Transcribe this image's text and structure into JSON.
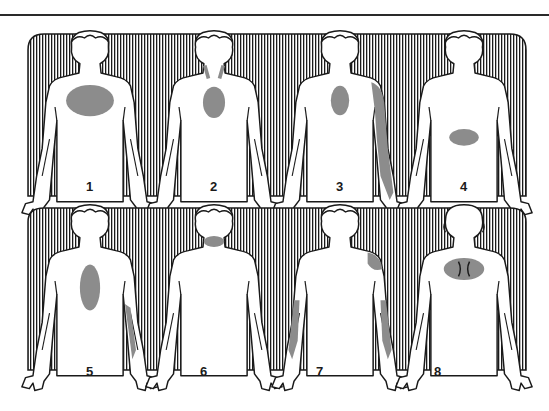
{
  "colors": {
    "line": "#1a1a1a",
    "hatch": "#1a1a1a",
    "figure_fill": "#ffffff",
    "pain_area": "#8c8c8c",
    "background": "#ffffff"
  },
  "rows": [
    {
      "name": "top-row",
      "figures": [
        {
          "label": "1",
          "view": "front",
          "pain_areas": [
            "central chest (wide)"
          ]
        },
        {
          "label": "2",
          "view": "front",
          "pain_areas": [
            "central chest (small)",
            "neck sides"
          ]
        },
        {
          "label": "3",
          "view": "front",
          "pain_areas": [
            "central chest",
            "left shoulder",
            "left arm"
          ]
        },
        {
          "label": "4",
          "view": "front",
          "pain_areas": [
            "upper abdomen"
          ]
        }
      ]
    },
    {
      "name": "bottom-row",
      "figures": [
        {
          "label": "5",
          "view": "front",
          "pain_areas": [
            "central chest (vertical)",
            "left inner arm"
          ]
        },
        {
          "label": "6",
          "view": "front",
          "pain_areas": [
            "jaw / throat"
          ]
        },
        {
          "label": "7",
          "view": "front",
          "pain_areas": [
            "left shoulder",
            "both arms"
          ]
        },
        {
          "label": "8",
          "view": "back",
          "pain_areas": [
            "between shoulder blades"
          ]
        }
      ]
    }
  ]
}
